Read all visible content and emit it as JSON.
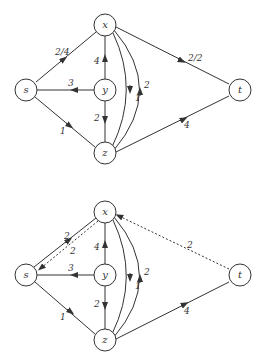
{
  "graphs": [
    {
      "name": "flow-network",
      "nodes": {
        "s": "s",
        "x": "x",
        "y": "y",
        "z": "z",
        "t": "t"
      },
      "edges": [
        {
          "from": "s",
          "to": "x",
          "label": "2/4"
        },
        {
          "from": "y",
          "to": "s",
          "label": "3"
        },
        {
          "from": "s",
          "to": "z",
          "label": "1"
        },
        {
          "from": "y",
          "to": "x",
          "label": "4"
        },
        {
          "from": "y",
          "to": "z",
          "label": "2"
        },
        {
          "from": "x",
          "to": "z",
          "label": "1"
        },
        {
          "from": "z",
          "to": "x",
          "label": "2"
        },
        {
          "from": "x",
          "to": "t",
          "label": "2/2"
        },
        {
          "from": "z",
          "to": "t",
          "label": "4"
        }
      ]
    },
    {
      "name": "residual-network",
      "nodes": {
        "s": "s",
        "x": "x",
        "y": "y",
        "z": "z",
        "t": "t"
      },
      "edges": [
        {
          "from": "s",
          "to": "x",
          "label": "2"
        },
        {
          "from": "x",
          "to": "s",
          "label": "2",
          "style": "dashed"
        },
        {
          "from": "y",
          "to": "s",
          "label": "3"
        },
        {
          "from": "s",
          "to": "z",
          "label": "1"
        },
        {
          "from": "y",
          "to": "x",
          "label": "4"
        },
        {
          "from": "y",
          "to": "z",
          "label": "2"
        },
        {
          "from": "x",
          "to": "z",
          "label": "1"
        },
        {
          "from": "z",
          "to": "x",
          "label": "2"
        },
        {
          "from": "t",
          "to": "x",
          "label": "2",
          "style": "dashed"
        },
        {
          "from": "z",
          "to": "t",
          "label": "4"
        }
      ]
    }
  ]
}
